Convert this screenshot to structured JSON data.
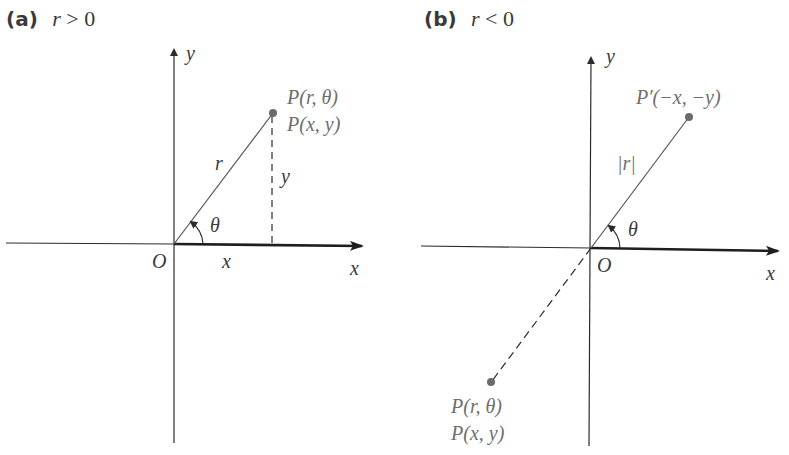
{
  "panels": [
    {
      "tag": "(a)",
      "condition_var": "r",
      "condition_op": ">",
      "condition_val": "0",
      "axis_x": "x",
      "axis_y": "y",
      "origin": "O",
      "point_label_1": "P(r, θ)",
      "point_label_2": "P(x, y)",
      "radius_label": "r",
      "x_segment_label": "x",
      "y_segment_label": "y",
      "angle_label": "θ"
    },
    {
      "tag": "(b)",
      "condition_var": "r",
      "condition_op": "<",
      "condition_val": "0",
      "axis_x": "x",
      "axis_y": "y",
      "origin": "O",
      "reflected_point_label": "P′(−x, −y)",
      "point_label_1": "P(r, θ)",
      "point_label_2": "P(x, y)",
      "radius_label": "|r|",
      "angle_label": "θ"
    }
  ],
  "colors": {
    "axis": "#2b2b2b",
    "point": "#6a6a6a",
    "text": "#3a3a3a",
    "gray_text": "#6e6e6e"
  }
}
